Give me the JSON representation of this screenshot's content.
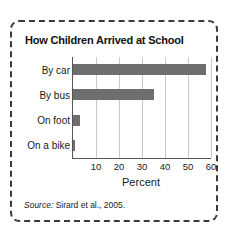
{
  "figure": {
    "title": "How Children Arrived at School",
    "source_label": "Source:",
    "source_text": " Sirard et al., 2005."
  },
  "chart_data": {
    "type": "bar",
    "orientation": "horizontal",
    "title": "How Children Arrived at School",
    "categories": [
      "By car",
      "By bus",
      "On foot",
      "On a bike"
    ],
    "values": [
      58,
      35,
      3,
      1
    ],
    "series": [
      {
        "name": "Percent",
        "values": [
          58,
          35,
          3,
          1
        ]
      }
    ],
    "xlabel": "Percent",
    "ylabel": "",
    "xlim": [
      0,
      60
    ],
    "xticks": [
      10,
      20,
      30,
      40,
      50,
      60
    ],
    "xtick_labels": [
      "10",
      "20",
      "30",
      "40",
      "50",
      "60"
    ],
    "grid": true,
    "grid_axis": "x",
    "legend": false,
    "bar_color": "#6e6e6e",
    "axis_color": "#555555",
    "gridline_color": "#c9c9c9"
  }
}
